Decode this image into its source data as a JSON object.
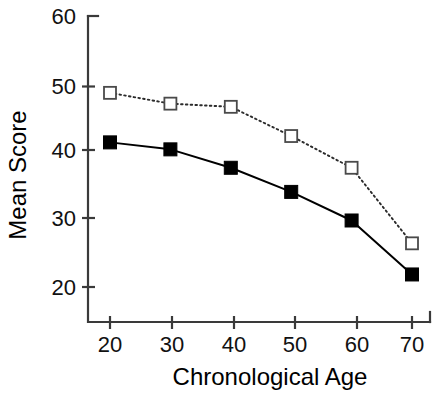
{
  "chart_data": {
    "type": "line",
    "title": "",
    "subtitle": "",
    "xlabel": "Chronological Age",
    "ylabel": "Mean Score",
    "x": [
      20,
      30,
      40,
      50,
      60,
      70
    ],
    "xticklabels": [
      "20",
      "30",
      "40",
      "50",
      "60",
      "70"
    ],
    "yticks": [
      20,
      30,
      40,
      50,
      60
    ],
    "yticklabels": [
      "20",
      "30",
      "40",
      "50",
      "60"
    ],
    "xlim": [
      15,
      75
    ],
    "ylim": [
      16,
      60
    ],
    "grid": false,
    "legend": "none",
    "series": [
      {
        "name": "open-square-series",
        "marker": "open-square",
        "linestyle": "dotted",
        "color": "#2b2b2b",
        "values": [
          49.0,
          47.3,
          46.8,
          42.2,
          37.2,
          25.3
        ]
      },
      {
        "name": "filled-square-series",
        "marker": "filled-square",
        "linestyle": "solid",
        "color": "#000000",
        "values": [
          41.2,
          40.1,
          37.2,
          33.4,
          28.9,
          20.4
        ]
      }
    ]
  },
  "axes": {
    "y_title": "Mean Score",
    "x_title": "Chronological Age"
  },
  "ticks": {
    "y": [
      "60",
      "50",
      "40",
      "30",
      "20"
    ],
    "x": [
      "20",
      "30",
      "40",
      "50",
      "60",
      "70"
    ]
  },
  "colors": {
    "background": "#ffffff",
    "ink": "#000000",
    "spine": "#3a3a3a",
    "open_marker_fill": "#ffffff",
    "open_marker_stroke": "#4a4a4a"
  }
}
